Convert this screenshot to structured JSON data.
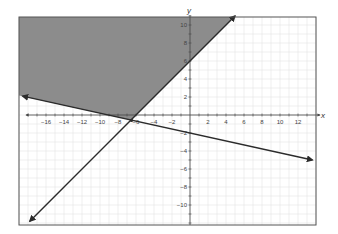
{
  "chart_data": {
    "type": "line",
    "title": "",
    "xlabel": "x",
    "ylabel": "y",
    "xlim": [
      -19,
      14
    ],
    "ylim": [
      -12,
      11
    ],
    "grid": true,
    "x_ticks": [
      -16,
      -14,
      -12,
      -10,
      -8,
      -6,
      -4,
      -2,
      2,
      4,
      6,
      8,
      10,
      12
    ],
    "y_ticks": [
      10,
      8,
      6,
      4,
      2,
      -2,
      -4,
      -6,
      -8,
      -10
    ],
    "series": [
      {
        "name": "line-1",
        "equation": "y = x + 6",
        "slope": 1,
        "intercept": 6,
        "style": "solid",
        "arrows": true,
        "x": [
          -17.8,
          5
        ],
        "y": [
          -11.8,
          11
        ]
      },
      {
        "name": "line-2",
        "equation": "y = -0.22x - 2",
        "slope": -0.22,
        "intercept": -2,
        "style": "solid",
        "arrows": true,
        "x": [
          -18.6,
          13.6
        ],
        "y": [
          2.1,
          -5.0
        ]
      }
    ],
    "shaded_region": {
      "description": "y >= x + 6 and y >= -0.22x - 2",
      "color": "#8c8c8c"
    },
    "intersection": {
      "x": -6.5,
      "y": -0.6
    }
  },
  "colors": {
    "shade": "#8c8c8c",
    "line": "#2b2b2b",
    "grid": "#dcdcdc",
    "frame": "#555555"
  }
}
